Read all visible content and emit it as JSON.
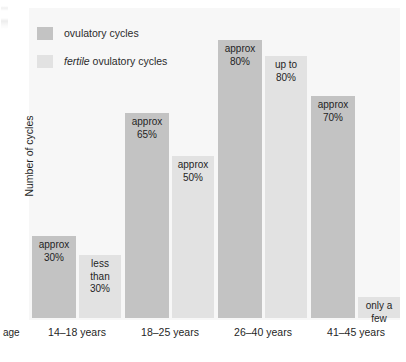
{
  "figure": {
    "y_axis_title": "Number of cycles",
    "x_axis_prefix": "age"
  },
  "legend": {
    "items": [
      {
        "label_plain": "ovulatory cycles",
        "label_em": "",
        "label_rest": "",
        "swatch": "dark",
        "color": "#c3c3c3"
      },
      {
        "label_plain": "",
        "label_em": "fertile",
        "label_rest": " ovulatory cycles",
        "swatch": "light",
        "color": "#e2e2e2"
      }
    ]
  },
  "chart_data": {
    "type": "bar",
    "title": "",
    "subtitle": "",
    "xlabel": "age",
    "ylabel": "Number of cycles",
    "grid": false,
    "legend_position": "top-left",
    "axis_tick_labels_visible": false,
    "categories": [
      "14–18 years",
      "18–25 years",
      "26–40 years",
      "41–45 years"
    ],
    "series": [
      {
        "name": "ovulatory cycles",
        "color": "#c3c3c3",
        "values": [
          30,
          65,
          80,
          70
        ],
        "value_labels": [
          "approx\n30%",
          "approx\n65%",
          "approx\n80%",
          "approx\n70%"
        ]
      },
      {
        "name": "fertile ovulatory cycles",
        "color": "#e2e2e2",
        "values": [
          25,
          50,
          80,
          5
        ],
        "value_labels": [
          "less\nthan\n30%",
          "approx\n50%",
          "up to\n80%",
          "only a\nfew"
        ]
      }
    ],
    "ylim": [
      0,
      100
    ]
  },
  "bars": [
    {
      "group": "14–18 years",
      "series": "ovulatory cycles",
      "label": "approx\n30%",
      "left": 32,
      "top": 236,
      "width": 44,
      "height": 82,
      "tone": "dark"
    },
    {
      "group": "14–18 years",
      "series": "fertile ovulatory cycles",
      "label": "less\nthan\n30%",
      "left": 79,
      "top": 255,
      "width": 42,
      "height": 63,
      "tone": "light"
    },
    {
      "group": "18–25 years",
      "series": "ovulatory cycles",
      "label": "approx\n65%",
      "left": 125,
      "top": 113,
      "width": 44,
      "height": 205,
      "tone": "dark"
    },
    {
      "group": "18–25 years",
      "series": "fertile ovulatory cycles",
      "label": "approx\n50%",
      "left": 172,
      "top": 156,
      "width": 42,
      "height": 162,
      "tone": "light"
    },
    {
      "group": "26–40 years",
      "series": "ovulatory cycles",
      "label": "approx\n80%",
      "left": 218,
      "top": 40,
      "width": 44,
      "height": 278,
      "tone": "dark"
    },
    {
      "group": "26–40 years",
      "series": "fertile ovulatory cycles",
      "label": "up to\n80%",
      "left": 265,
      "top": 56,
      "width": 42,
      "height": 262,
      "tone": "light"
    },
    {
      "group": "41–45 years",
      "series": "ovulatory cycles",
      "label": "approx\n70%",
      "left": 311,
      "top": 96,
      "width": 44,
      "height": 222,
      "tone": "dark"
    },
    {
      "group": "41–45 years",
      "series": "fertile ovulatory cycles",
      "label": "only a\nfew",
      "left": 358,
      "top": 297,
      "width": 42,
      "height": 21,
      "tone": "light"
    }
  ],
  "x_ticks": [
    {
      "label": "14–18 years",
      "left": 31,
      "width": 92
    },
    {
      "label": "18–25 years",
      "left": 124,
      "width": 92
    },
    {
      "label": "26–40 years",
      "left": 217,
      "width": 92
    },
    {
      "label": "41–45 years",
      "left": 310,
      "width": 92
    }
  ]
}
